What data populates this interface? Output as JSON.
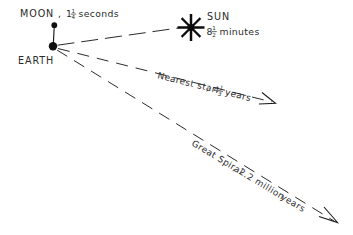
{
  "figure": {
    "kind": "astronomy-scale-diagram",
    "background_color": "#ffffff",
    "ink_color": "#1a1a1a"
  },
  "bodies": {
    "moon": {
      "name": "MOON",
      "separator": ", ",
      "value_whole": "1",
      "value_frac_num": "1",
      "value_frac_den": "4",
      "unit": "seconds",
      "marker": "filled-dot"
    },
    "earth": {
      "name": "EARTH",
      "marker": "filled-dot"
    },
    "sun": {
      "name": "SUN",
      "value_whole": "8",
      "value_frac_num": "1",
      "value_frac_den": "2",
      "unit": "minutes",
      "marker": "starburst"
    }
  },
  "rays": {
    "nearest_star": {
      "name": "Nearest star",
      "separator": ", ",
      "value_whole": "4",
      "value_frac_num": "1",
      "value_frac_den": "3",
      "unit": "years",
      "arrow": "open-v-arrowhead"
    },
    "great_spiral": {
      "name": "Great Spiral",
      "separator": ", ",
      "value": "2.2 million",
      "unit": "years",
      "arrow": "open-v-arrowhead"
    }
  }
}
